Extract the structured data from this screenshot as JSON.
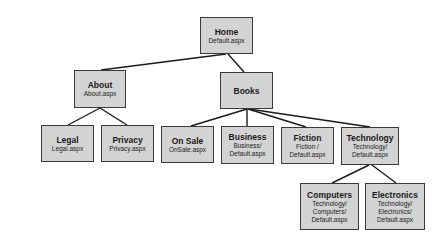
{
  "diagram": {
    "type": "site-map-tree",
    "style": {
      "node_fill": "#d3d3d3",
      "node_border": "#3a3a3a",
      "link_color": "#1a1a1a"
    },
    "nodes": [
      {
        "id": "home",
        "title": "Home",
        "url": "Default.aspx",
        "x": 200,
        "y": 17,
        "w": 53,
        "h": 37
      },
      {
        "id": "about",
        "title": "About",
        "url": "About.aspx",
        "x": 74,
        "y": 70,
        "w": 52,
        "h": 38
      },
      {
        "id": "books",
        "title": "Books",
        "url": "",
        "x": 220,
        "y": 72,
        "w": 53,
        "h": 37
      },
      {
        "id": "legal",
        "title": "Legal",
        "url": "Legal.aspx",
        "x": 41,
        "y": 125,
        "w": 53,
        "h": 37
      },
      {
        "id": "privacy",
        "title": "Privacy",
        "url": "Privacy.aspx",
        "x": 101,
        "y": 125,
        "w": 53,
        "h": 37
      },
      {
        "id": "onsale",
        "title": "On Sale",
        "url": "OnSale.aspx",
        "x": 161,
        "y": 126,
        "w": 53,
        "h": 37
      },
      {
        "id": "business",
        "title": "Business",
        "url": "Business/\nDefault.aspx",
        "x": 221,
        "y": 126,
        "w": 53,
        "h": 38
      },
      {
        "id": "fiction",
        "title": "Fiction",
        "url": "Fiction /\nDefault.aspx",
        "x": 281,
        "y": 127,
        "w": 53,
        "h": 37
      },
      {
        "id": "technology",
        "title": "Technology",
        "url": "Technology/\nDefault.aspx",
        "x": 341,
        "y": 127,
        "w": 58,
        "h": 38
      },
      {
        "id": "computers",
        "title": "Computers",
        "url": "Technology/\nComputers/\nDefault.aspx",
        "x": 300,
        "y": 183,
        "w": 59,
        "h": 47
      },
      {
        "id": "electronics",
        "title": "Electronics",
        "url": "Technology/\nElectronics/\nDefault.aspx",
        "x": 365,
        "y": 183,
        "w": 60,
        "h": 47
      }
    ],
    "edges": [
      {
        "from": "home",
        "to": "about",
        "x1": 226,
        "y1": 54,
        "x2": 101,
        "y2": 70
      },
      {
        "from": "home",
        "to": "books",
        "x1": 228,
        "y1": 54,
        "x2": 244,
        "y2": 72
      },
      {
        "from": "about",
        "to": "legal",
        "x1": 100,
        "y1": 108,
        "x2": 68,
        "y2": 125
      },
      {
        "from": "about",
        "to": "privacy",
        "x1": 100,
        "y1": 108,
        "x2": 127,
        "y2": 125
      },
      {
        "from": "books",
        "to": "onsale",
        "x1": 247,
        "y1": 109,
        "x2": 191,
        "y2": 126
      },
      {
        "from": "books",
        "to": "business",
        "x1": 247,
        "y1": 109,
        "x2": 247,
        "y2": 126
      },
      {
        "from": "books",
        "to": "fiction",
        "x1": 248,
        "y1": 109,
        "x2": 306,
        "y2": 127
      },
      {
        "from": "books",
        "to": "technology",
        "x1": 249,
        "y1": 109,
        "x2": 370,
        "y2": 127
      },
      {
        "from": "technology",
        "to": "computers",
        "x1": 369,
        "y1": 165,
        "x2": 332,
        "y2": 183
      },
      {
        "from": "technology",
        "to": "electronics",
        "x1": 372,
        "y1": 165,
        "x2": 396,
        "y2": 183
      }
    ]
  }
}
